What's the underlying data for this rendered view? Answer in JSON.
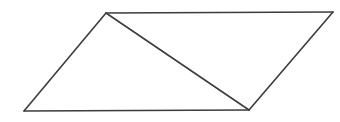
{
  "diagram": {
    "type": "parallelogram-with-diagonal",
    "background": "#ffffff",
    "stroke_color": "#3c3c3c",
    "stroke_width": 1.6,
    "vertices": {
      "top_left": [
        106,
        13
      ],
      "top_right": [
        333,
        12
      ],
      "bottom_right": [
        249,
        110
      ],
      "bottom_left": [
        24,
        111
      ]
    },
    "edges": [
      {
        "name": "top-edge",
        "from": "top_left",
        "to": "top_right"
      },
      {
        "name": "right-edge",
        "from": "top_right",
        "to": "bottom_right"
      },
      {
        "name": "bottom-edge",
        "from": "bottom_right",
        "to": "bottom_left"
      },
      {
        "name": "left-edge",
        "from": "bottom_left",
        "to": "top_left"
      },
      {
        "name": "diagonal",
        "from": "top_left",
        "to": "bottom_right"
      }
    ]
  }
}
